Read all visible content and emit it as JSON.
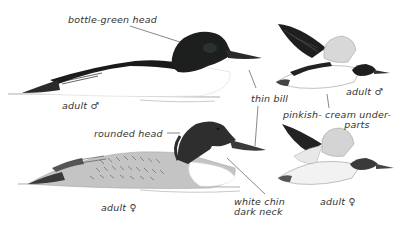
{
  "illustration": {
    "subject": "merganser field marks",
    "colors": {
      "background": "#ffffff",
      "ink": "#1a1a1a",
      "head_dark": "#1c1f1d",
      "female_head": "#2e2e2e",
      "gray_body": "#b8b8b8",
      "leader_line": "#555555",
      "label_text": "#333333"
    },
    "birds": [
      {
        "id": "male-swimming",
        "caption": "adult ♂"
      },
      {
        "id": "female-swimming",
        "caption": "adult ♀"
      },
      {
        "id": "male-flying",
        "caption": "adult ♂"
      },
      {
        "id": "female-flying",
        "caption": "adult ♀"
      }
    ],
    "annotations": {
      "bottle_green_head": "bottle-green head",
      "thin_bill": "thin bill",
      "pinkish_cream": "pinkish- cream under-\n                   parts",
      "rounded_head": "rounded head",
      "white_chin": "white chin\ndark neck"
    }
  }
}
